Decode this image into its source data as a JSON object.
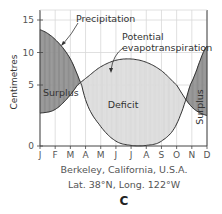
{
  "chart_data": {
    "type": "area",
    "title": "",
    "xlabel": "Berkeley, California, U.S.A.",
    "subtitle": "Lat. 38°N, Long. 122°W",
    "panel_label": "C",
    "ylabel": "Centimetres",
    "ylim": [
      0,
      15
    ],
    "yticks": [
      0,
      5,
      10,
      15
    ],
    "categories": [
      "J",
      "F",
      "M",
      "A",
      "M",
      "J",
      "J",
      "A",
      "S",
      "O",
      "N",
      "D"
    ],
    "grid": true,
    "series": [
      {
        "name": "Precipitation",
        "values": [
          13.5,
          12.0,
          9.0,
          3.8,
          1.6,
          0.4,
          0.05,
          0.05,
          0.4,
          1.8,
          5.5,
          11.0
        ]
      },
      {
        "name": "Potential evapotranspiration",
        "values": [
          2.7,
          3.0,
          4.2,
          6.0,
          7.8,
          8.8,
          9.0,
          8.5,
          7.2,
          5.0,
          3.2,
          2.5
        ]
      }
    ],
    "annotations": [
      {
        "text": "Precipitation",
        "target": "Precipitation"
      },
      {
        "text_lines": [
          "Potential",
          "evapotranspiration"
        ],
        "target": "Potential evapotranspiration"
      },
      {
        "text": "Surplus",
        "region": "Jan-Mar"
      },
      {
        "text": "Deficit",
        "region": "Apr-Nov"
      },
      {
        "text": "Surplus",
        "region": "Nov-Dec",
        "rotated": true
      }
    ],
    "colors": {
      "surplus": "#8f8f8f",
      "deficit": "#dcdcdc",
      "grid": "#d8d8d8",
      "axis": "#444444",
      "line": "#333333"
    }
  }
}
